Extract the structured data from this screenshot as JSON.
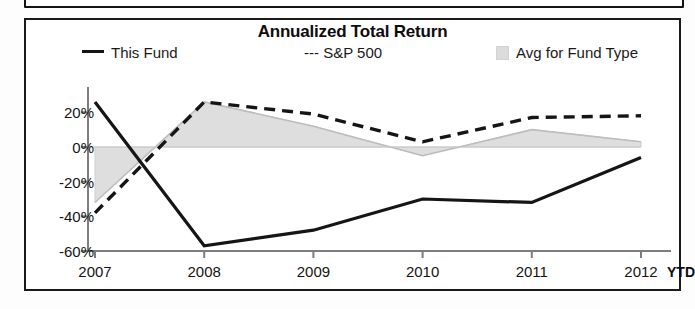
{
  "chart_panel": {
    "title": "Annualized Total Return"
  },
  "legend": {
    "items": [
      {
        "label": "This Fund",
        "marker": "solid-line-swatch",
        "color": "#151515"
      },
      {
        "label": "--- S&P 500",
        "marker": "dashed-line-swatch",
        "color": "#151515"
      },
      {
        "label": "Avg for Fund Type",
        "marker": "area-swatch",
        "color": "#dcdcdc"
      }
    ]
  },
  "axis": {
    "x_suffix_label": "YTD",
    "y_tick_labels": [
      "20%",
      "0%",
      "-20%",
      "-40%",
      "-60%"
    ],
    "x_tick_labels": [
      "2007",
      "2008",
      "2009",
      "2010",
      "2011",
      "2012"
    ]
  },
  "chart_data": {
    "type": "line",
    "title": "Annualized Total Return",
    "xlabel": "",
    "ylabel": "",
    "categories": [
      "2007",
      "2008",
      "2009",
      "2010",
      "2011",
      "2012"
    ],
    "x_note": "2012 value is year-to-date (YTD)",
    "ylim": [
      -60,
      30
    ],
    "y_ticks": [
      20,
      0,
      -20,
      -40,
      -60
    ],
    "grid": false,
    "zero_line": true,
    "legend_position": "top",
    "series": [
      {
        "name": "This Fund",
        "style": "solid",
        "color": "#151515",
        "values": [
          26,
          -57,
          -48,
          -30,
          -32,
          -6
        ]
      },
      {
        "name": "S&P 500",
        "style": "dashed",
        "color": "#151515",
        "values": [
          -38,
          26,
          19,
          3,
          17,
          18
        ]
      },
      {
        "name": "Avg for Fund Type",
        "style": "filled-area",
        "color": "#dcdcdc",
        "values": [
          -32,
          26,
          12,
          -5,
          10,
          3
        ]
      }
    ]
  }
}
